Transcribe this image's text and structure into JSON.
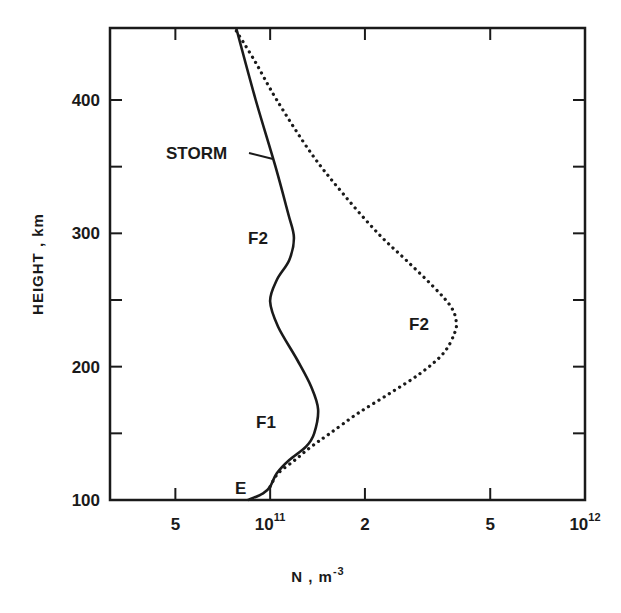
{
  "chart_data": {
    "type": "line",
    "title": "",
    "xlabel": "N , m^-3",
    "xlabel_base": "N , m",
    "xlabel_exp": "-3",
    "ylabel": "HEIGHT , km",
    "xscale": "log",
    "xlim": [
      31000000000.0,
      1000000000000.0
    ],
    "ylim": [
      100,
      454
    ],
    "grid": false,
    "legend": "none (curves labeled inline)",
    "x_ticks": [
      {
        "value": 50000000000.0,
        "label": "5"
      },
      {
        "value": 100000000000.0,
        "label": "10",
        "sup": "11"
      },
      {
        "value": 200000000000.0,
        "label": "2"
      },
      {
        "value": 500000000000.0,
        "label": "5"
      },
      {
        "value": 1000000000000.0,
        "label": "10",
        "sup": "12"
      }
    ],
    "y_ticks": [
      {
        "value": 100,
        "label": "100"
      },
      {
        "value": 150,
        "label": ""
      },
      {
        "value": 200,
        "label": "200"
      },
      {
        "value": 250,
        "label": ""
      },
      {
        "value": 300,
        "label": "300"
      },
      {
        "value": 350,
        "label": ""
      },
      {
        "value": 400,
        "label": "400"
      }
    ],
    "series": [
      {
        "name": "STORM",
        "style": "solid",
        "points": [
          {
            "h": 100,
            "n": 85000000000.0
          },
          {
            "h": 105,
            "n": 95000000000.0
          },
          {
            "h": 110,
            "n": 100000000000.0
          },
          {
            "h": 120,
            "n": 105000000000.0
          },
          {
            "h": 130,
            "n": 115000000000.0
          },
          {
            "h": 140,
            "n": 130000000000.0
          },
          {
            "h": 150,
            "n": 138000000000.0
          },
          {
            "h": 168,
            "n": 142000000000.0
          },
          {
            "h": 185,
            "n": 135000000000.0
          },
          {
            "h": 205,
            "n": 122000000000.0
          },
          {
            "h": 230,
            "n": 106000000000.0
          },
          {
            "h": 249,
            "n": 100000000000.0
          },
          {
            "h": 265,
            "n": 105000000000.0
          },
          {
            "h": 280,
            "n": 115000000000.0
          },
          {
            "h": 297,
            "n": 119000000000.0
          },
          {
            "h": 315,
            "n": 114000000000.0
          },
          {
            "h": 350,
            "n": 104000000000.0
          },
          {
            "h": 400,
            "n": 90000000000.0
          },
          {
            "h": 454,
            "n": 78000000000.0
          }
        ]
      },
      {
        "name": "QUIET",
        "style": "dotted",
        "points": [
          {
            "h": 110,
            "n": 100000000000.0
          },
          {
            "h": 120,
            "n": 106000000000.0
          },
          {
            "h": 130,
            "n": 120000000000.0
          },
          {
            "h": 140,
            "n": 135000000000.0
          },
          {
            "h": 150,
            "n": 155000000000.0
          },
          {
            "h": 165,
            "n": 190000000000.0
          },
          {
            "h": 180,
            "n": 240000000000.0
          },
          {
            "h": 195,
            "n": 300000000000.0
          },
          {
            "h": 210,
            "n": 355000000000.0
          },
          {
            "h": 225,
            "n": 385000000000.0
          },
          {
            "h": 234,
            "n": 390000000000.0
          },
          {
            "h": 245,
            "n": 375000000000.0
          },
          {
            "h": 260,
            "n": 330000000000.0
          },
          {
            "h": 280,
            "n": 270000000000.0
          },
          {
            "h": 300,
            "n": 220000000000.0
          },
          {
            "h": 330,
            "n": 170000000000.0
          },
          {
            "h": 360,
            "n": 135000000000.0
          },
          {
            "h": 400,
            "n": 105000000000.0
          },
          {
            "h": 430,
            "n": 89000000000.0
          },
          {
            "h": 454,
            "n": 77000000000.0
          }
        ]
      }
    ],
    "annotations": [
      {
        "text": "STORM",
        "target": "STORM curve",
        "h": 365,
        "pointer": true
      },
      {
        "text": "F2",
        "target": "storm F2 layer",
        "h": 297
      },
      {
        "text": "F2",
        "target": "quiet F2 peak",
        "h": 234
      },
      {
        "text": "F1",
        "target": "storm F1 layer",
        "h": 168
      },
      {
        "text": "E",
        "target": "E layer",
        "h": 105
      }
    ]
  },
  "labels": {
    "storm": "STORM",
    "f2_storm": "F2",
    "f2_quiet": "F2",
    "f1": "F1",
    "e": "E"
  },
  "colors": {
    "ink": "#1a1a1a",
    "background": "#ffffff"
  }
}
